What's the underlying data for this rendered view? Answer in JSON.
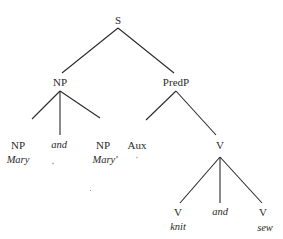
{
  "diagram": {
    "type": "syntax-tree",
    "nodes": {
      "s": {
        "label": "S",
        "x": 118,
        "y": 20
      },
      "np": {
        "label": "NP",
        "x": 60,
        "y": 82
      },
      "predp": {
        "label": "PredP",
        "x": 176,
        "y": 82
      },
      "np1": {
        "label": "NP",
        "x": 18,
        "y": 145
      },
      "np_and": {
        "label": "and",
        "x": 59,
        "y": 145
      },
      "np2": {
        "label": "NP",
        "x": 103,
        "y": 145
      },
      "aux": {
        "label": "Aux",
        "x": 137,
        "y": 145
      },
      "v": {
        "label": "V",
        "x": 220,
        "y": 145
      },
      "v1": {
        "label": "V",
        "x": 178,
        "y": 212
      },
      "v_and": {
        "label": "and",
        "x": 220,
        "y": 212
      },
      "v2": {
        "label": "V",
        "x": 263,
        "y": 212
      }
    },
    "leaves": {
      "mary": {
        "label": "Mary",
        "x": 18,
        "y": 160
      },
      "mary_prime": {
        "label": "Mary'",
        "x": 105,
        "y": 160
      },
      "knit": {
        "label": "knit",
        "x": 178,
        "y": 227
      },
      "sew": {
        "label": "sew",
        "x": 265,
        "y": 228
      }
    },
    "edges": [
      {
        "from": "S",
        "to": "NP",
        "x1": 118,
        "y1": 28,
        "x2": 62,
        "y2": 73
      },
      {
        "from": "S",
        "to": "PredP",
        "x1": 118,
        "y1": 28,
        "x2": 174,
        "y2": 73
      },
      {
        "from": "NP",
        "to": "NP",
        "x1": 60,
        "y1": 91,
        "x2": 32,
        "y2": 119
      },
      {
        "from": "NP",
        "to": "and",
        "x1": 60,
        "y1": 91,
        "x2": 60,
        "y2": 135
      },
      {
        "from": "NP",
        "to": "NP",
        "x1": 60,
        "y1": 91,
        "x2": 100,
        "y2": 118
      },
      {
        "from": "PredP",
        "to": "Aux",
        "x1": 176,
        "y1": 91,
        "x2": 146,
        "y2": 120
      },
      {
        "from": "PredP",
        "to": "V",
        "x1": 176,
        "y1": 91,
        "x2": 216,
        "y2": 135
      },
      {
        "from": "V",
        "to": "V",
        "x1": 220,
        "y1": 157,
        "x2": 180,
        "y2": 203
      },
      {
        "from": "V",
        "to": "and",
        "x1": 220,
        "y1": 157,
        "x2": 220,
        "y2": 203
      },
      {
        "from": "V",
        "to": "V",
        "x1": 220,
        "y1": 157,
        "x2": 262,
        "y2": 203
      }
    ]
  }
}
